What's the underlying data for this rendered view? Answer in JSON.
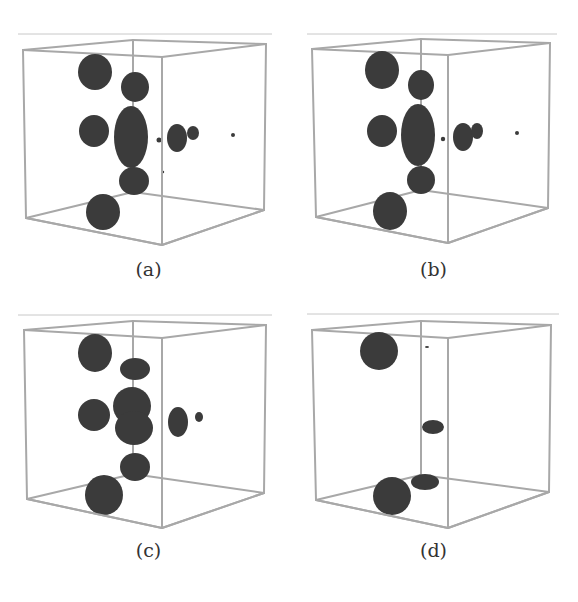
{
  "figure": {
    "edge_color": "#a8a8a8",
    "blob_color": "#3b3b3b",
    "rule_color": "#c8c8c8",
    "panels": [
      {
        "id": "a",
        "caption": "(a)",
        "offset": [
          0,
          0
        ],
        "cube": {
          "tl": [
            23,
            50
          ],
          "tf": [
            162,
            57
          ],
          "tr": [
            266,
            44
          ],
          "tb": [
            133,
            40
          ],
          "bl": [
            26,
            218
          ],
          "bf": [
            162,
            245
          ],
          "br": [
            264,
            210
          ],
          "bb": [
            133,
            192
          ]
        },
        "rule": [
          18,
          34,
          272
        ],
        "caption_y": 270,
        "blobs": [
          {
            "cx": 95,
            "cy": 72,
            "rx": 17,
            "ry": 18
          },
          {
            "cx": 135,
            "cy": 87,
            "rx": 14,
            "ry": 15
          },
          {
            "cx": 94,
            "cy": 131,
            "rx": 15,
            "ry": 16
          },
          {
            "cx": 131,
            "cy": 137,
            "rx": 17,
            "ry": 31
          },
          {
            "cx": 134,
            "cy": 181,
            "rx": 15,
            "ry": 14
          },
          {
            "cx": 103,
            "cy": 212,
            "rx": 17,
            "ry": 18
          },
          {
            "cx": 177,
            "cy": 138,
            "rx": 10,
            "ry": 14
          },
          {
            "cx": 193,
            "cy": 133,
            "rx": 6,
            "ry": 7
          },
          {
            "cx": 159,
            "cy": 140,
            "rx": 2.5,
            "ry": 2.5
          },
          {
            "cx": 233,
            "cy": 135,
            "rx": 2,
            "ry": 2
          },
          {
            "cx": 163,
            "cy": 172,
            "rx": 1.2,
            "ry": 1.2
          }
        ]
      },
      {
        "id": "b",
        "caption": "(b)",
        "offset": [
          289,
          0
        ],
        "cube": {
          "tl": [
            23,
            49
          ],
          "tf": [
            159,
            55
          ],
          "tr": [
            261,
            43
          ],
          "tb": [
            132,
            39
          ],
          "bl": [
            27,
            217
          ],
          "bf": [
            159,
            243
          ],
          "br": [
            259,
            208
          ],
          "bb": [
            132,
            190
          ]
        },
        "rule": [
          18,
          34,
          268
        ],
        "caption_y": 270,
        "blobs": [
          {
            "cx": 93,
            "cy": 70,
            "rx": 17,
            "ry": 19
          },
          {
            "cx": 132,
            "cy": 85,
            "rx": 13,
            "ry": 15
          },
          {
            "cx": 93,
            "cy": 131,
            "rx": 15,
            "ry": 16
          },
          {
            "cx": 129,
            "cy": 135,
            "rx": 17,
            "ry": 31
          },
          {
            "cx": 132,
            "cy": 180,
            "rx": 14,
            "ry": 14
          },
          {
            "cx": 101,
            "cy": 211,
            "rx": 17,
            "ry": 19
          },
          {
            "cx": 174,
            "cy": 137,
            "rx": 10,
            "ry": 14
          },
          {
            "cx": 188,
            "cy": 131,
            "rx": 6,
            "ry": 8
          },
          {
            "cx": 154,
            "cy": 139,
            "rx": 2.2,
            "ry": 2.2
          },
          {
            "cx": 228,
            "cy": 133,
            "rx": 2,
            "ry": 2
          }
        ]
      },
      {
        "id": "c",
        "caption": "(c)",
        "offset": [
          0,
          281
        ],
        "cube": {
          "tl": [
            24,
            49
          ],
          "tf": [
            162,
            57
          ],
          "tr": [
            266,
            44
          ],
          "tb": [
            133,
            40
          ],
          "bl": [
            27,
            218
          ],
          "bf": [
            162,
            247
          ],
          "br": [
            264,
            212
          ],
          "bb": [
            133,
            193
          ]
        },
        "rule": [
          18,
          34,
          272
        ],
        "caption_y": 270,
        "blobs": [
          {
            "cx": 95,
            "cy": 72,
            "rx": 17,
            "ry": 19
          },
          {
            "cx": 135,
            "cy": 88,
            "rx": 15,
            "ry": 11
          },
          {
            "cx": 94,
            "cy": 134,
            "rx": 16,
            "ry": 16
          },
          {
            "cx": 132,
            "cy": 125,
            "rx": 19,
            "ry": 19
          },
          {
            "cx": 134,
            "cy": 147,
            "rx": 19,
            "ry": 17
          },
          {
            "cx": 135,
            "cy": 186,
            "rx": 15,
            "ry": 14
          },
          {
            "cx": 104,
            "cy": 214,
            "rx": 19,
            "ry": 20
          },
          {
            "cx": 178,
            "cy": 141,
            "rx": 10,
            "ry": 15
          },
          {
            "cx": 199,
            "cy": 136,
            "rx": 4,
            "ry": 5
          }
        ]
      },
      {
        "id": "d",
        "caption": "(d)",
        "offset": [
          289,
          281
        ],
        "cube": {
          "tl": [
            23,
            49
          ],
          "tf": [
            159,
            57
          ],
          "tr": [
            262,
            44
          ],
          "tb": [
            132,
            40
          ],
          "bl": [
            27,
            219
          ],
          "bf": [
            159,
            247
          ],
          "br": [
            260,
            211
          ],
          "bb": [
            132,
            194
          ]
        },
        "rule": [
          18,
          33,
          270
        ],
        "caption_y": 270,
        "blobs": [
          {
            "cx": 90,
            "cy": 70,
            "rx": 19,
            "ry": 19
          },
          {
            "cx": 144,
            "cy": 146,
            "rx": 11,
            "ry": 7
          },
          {
            "cx": 136,
            "cy": 201,
            "rx": 14,
            "ry": 8
          },
          {
            "cx": 103,
            "cy": 215,
            "rx": 19,
            "ry": 19
          },
          {
            "cx": 138,
            "cy": 66,
            "rx": 2,
            "ry": 1
          }
        ]
      }
    ]
  }
}
